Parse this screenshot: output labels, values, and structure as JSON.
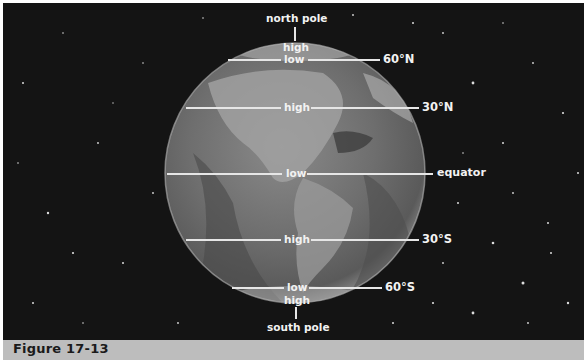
{
  "figure": {
    "caption": "Figure 17-13",
    "background_color": "#141414",
    "caption_bar_color": "#bdbdbd"
  },
  "poles": {
    "north": "north pole",
    "south": "south pole"
  },
  "latitudes": [
    {
      "name": "60N",
      "label": "60°N",
      "pressure": "low"
    },
    {
      "name": "30N",
      "label": "30°N",
      "pressure": "high"
    },
    {
      "name": "equator",
      "label": "equator",
      "pressure": "low"
    },
    {
      "name": "30S",
      "label": "30°S",
      "pressure": "high"
    },
    {
      "name": "60S",
      "label": "60°S",
      "pressure": "low"
    }
  ],
  "polar_pressure": {
    "north": "high",
    "south": "high"
  }
}
